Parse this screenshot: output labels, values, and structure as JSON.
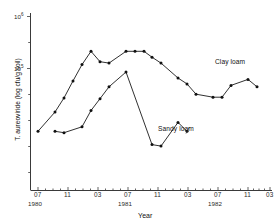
{
  "chart_data": {
    "type": "line",
    "title": "",
    "xlabel": "Year",
    "ylabel": "T. aureoviride (log cfu/g soil)",
    "y_tick_labels": [
      "10",
      "10"
    ],
    "y_tick_exponents": [
      "6",
      "5"
    ],
    "ylim_log": [
      4.0,
      6.35
    ],
    "grid": false,
    "legend": "annotations-inline",
    "x_tick_labels": [
      "07",
      "11",
      "03",
      "07",
      "11",
      "03",
      "07",
      "11",
      "03"
    ],
    "x_year_labels": [
      "1980",
      "1981",
      "1982"
    ],
    "x_minor_ticks_between": 3,
    "annotations": [
      {
        "text": "Clay loam",
        "series": "Clay loam"
      },
      {
        "text": "Sandy loam",
        "series": "Sandy loam"
      }
    ],
    "series": [
      {
        "name": "Clay loam",
        "x": [
          "07/1980",
          "09/1980",
          "10/1980",
          "11/1980",
          "12/1980",
          "01/1981",
          "02/1981",
          "03/1981",
          "05/1981",
          "06/1981",
          "07/1981",
          "09/1981",
          "11/1981",
          "01/1982",
          "03/1982",
          "05/1982",
          "07/1982",
          "09/1982",
          "11/1982",
          "01/1983",
          "03/1983"
        ],
        "x_px": [
          38,
          55,
          64,
          73,
          82,
          91,
          100,
          109,
          126,
          135,
          144,
          152,
          161,
          178,
          187,
          196,
          213,
          222,
          231,
          248,
          257
        ],
        "y_log": [
          4.8,
          5.06,
          5.25,
          5.48,
          5.7,
          5.88,
          5.74,
          5.72,
          5.88,
          5.88,
          5.88,
          5.8,
          5.72,
          5.52,
          5.44,
          5.3,
          5.26,
          5.26,
          5.42,
          5.5,
          5.4
        ],
        "values_cfu_per_g": [
          63000,
          115000,
          178000,
          302000,
          501000,
          759000,
          550000,
          525000,
          759000,
          759000,
          759000,
          631000,
          525000,
          331000,
          275000,
          200000,
          182000,
          182000,
          263000,
          316000,
          251000
        ]
      },
      {
        "name": "Sandy loam",
        "x": [
          "09/1980",
          "11/1980",
          "01/1981",
          "03/1981",
          "05/1981",
          "06/1981",
          "07/1981",
          "09/1981",
          "11/1981",
          "01/1982",
          "03/1982"
        ],
        "x_px": [
          55,
          64,
          82,
          91,
          100,
          109,
          126,
          152,
          161,
          178,
          187
        ],
        "y_log": [
          4.8,
          4.78,
          4.86,
          5.08,
          5.24,
          5.4,
          5.6,
          4.62,
          4.6,
          4.92,
          4.8
        ],
        "values_cfu_per_g": [
          63000,
          60000,
          72000,
          120000,
          174000,
          251000,
          398000,
          42000,
          40000,
          83000,
          63000
        ]
      }
    ]
  },
  "chart": {
    "y_top_label": "10",
    "y_top_exp": "6",
    "y_mid_label": "10",
    "y_mid_exp": "5",
    "x_axis_title": "Year",
    "y_axis_title": "T. aureoviride (log cfu/g soil)",
    "year_1": "1980",
    "year_2": "1981",
    "year_3": "1982",
    "ann_clay": "Clay loam",
    "ann_sandy": "Sandy loam",
    "xt_0": "07",
    "xt_1": "11",
    "xt_2": "03",
    "xt_3": "07",
    "xt_4": "11",
    "xt_5": "03",
    "xt_6": "07",
    "xt_7": "11",
    "xt_8": "03"
  },
  "colors": {
    "axis": "#3a3a3a",
    "line": "#1a1a1a",
    "point": "#111111",
    "background": "#ffffff"
  }
}
